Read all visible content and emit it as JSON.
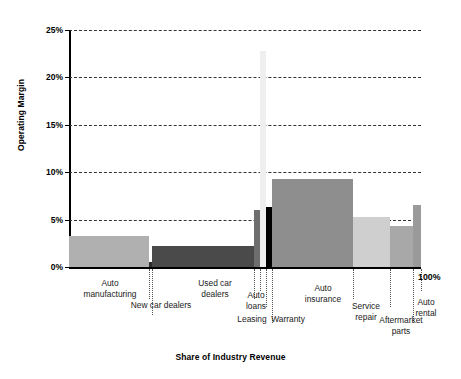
{
  "chart_data": {
    "type": "bar",
    "title": "",
    "xlabel": "Share of Industry Revenue",
    "ylabel": "Operating Margin",
    "ylim": [
      0,
      25
    ],
    "xlim": [
      0,
      100
    ],
    "grid": true,
    "legend": "none",
    "y_ticks": [
      "0%",
      "5%",
      "10%",
      "15%",
      "20%",
      "25%"
    ],
    "y_tick_values": [
      0,
      5,
      10,
      15,
      20,
      25
    ],
    "x_end_label": "100%",
    "note": "Marimekko / variable-width bar chart: bar width = share of industry revenue (%), bar height = operating margin (%)",
    "categories": [
      "Auto manufacturing",
      "New car dealers",
      "Used car dealers",
      "Auto loans",
      "Leasing",
      "Warranty",
      "Auto insurance",
      "Service repair",
      "Aftermarket parts",
      "Auto rental"
    ],
    "values": [
      3.3,
      0.5,
      2.2,
      6.0,
      22.8,
      6.3,
      9.3,
      5.3,
      4.3,
      6.5
    ],
    "widths": [
      22.7,
      0.9,
      29.0,
      1.6,
      1.9,
      1.6,
      23.0,
      10.5,
      6.6,
      2.2
    ],
    "colors": [
      "#b0b0b0",
      "#2e2e2e",
      "#4a4a4a",
      "#6e6e6e",
      "#efefef",
      "#000000",
      "#8e8e8e",
      "#cfcfcf",
      "#a8a8a8",
      "#9a9a9a"
    ],
    "bars": [
      {
        "label": "Auto\nmanufacturing",
        "value": 3.3,
        "width": 22.7,
        "color": "#b0b0b0"
      },
      {
        "label": "New car dealers",
        "value": 0.5,
        "width": 0.9,
        "color": "#2e2e2e"
      },
      {
        "label": "Used car\ndealers",
        "value": 2.2,
        "width": 29.0,
        "color": "#4a4a4a"
      },
      {
        "label": "Auto\nloans",
        "value": 6.0,
        "width": 1.6,
        "color": "#6e6e6e"
      },
      {
        "label": "Leasing",
        "value": 22.8,
        "width": 1.9,
        "color": "#efefef"
      },
      {
        "label": "Warranty",
        "value": 6.3,
        "width": 1.6,
        "color": "#000000"
      },
      {
        "label": "Auto\ninsurance",
        "value": 9.3,
        "width": 23.0,
        "color": "#8e8e8e"
      },
      {
        "label": "Service\nrepair",
        "value": 5.3,
        "width": 10.5,
        "color": "#cfcfcf"
      },
      {
        "label": "Aftermarket\nparts",
        "value": 4.3,
        "width": 6.6,
        "color": "#a8a8a8"
      },
      {
        "label": "Auto\nrental",
        "value": 6.5,
        "width": 2.2,
        "color": "#9a9a9a"
      }
    ]
  },
  "axis": {
    "y_title": "Operating Margin",
    "x_title": "Share of Industry Revenue",
    "x_end": "100%",
    "ticks": [
      {
        "label": "0%",
        "value": 0
      },
      {
        "label": "5%",
        "value": 5
      },
      {
        "label": "10%",
        "value": 10
      },
      {
        "label": "15%",
        "value": 15
      },
      {
        "label": "20%",
        "value": 20
      },
      {
        "label": "25%",
        "value": 25
      }
    ]
  },
  "labels": {
    "auto_manufacturing": "Auto\nmanufacturing",
    "new_car_dealers": "New car dealers",
    "used_car_dealers": "Used car\ndealers",
    "auto_loans": "Auto\nloans",
    "leasing": "Leasing",
    "warranty": "Warranty",
    "auto_insurance": "Auto\ninsurance",
    "service_repair": "Service\nrepair",
    "aftermarket_parts": "Aftermarket\nparts",
    "auto_rental": "Auto\nrental"
  }
}
